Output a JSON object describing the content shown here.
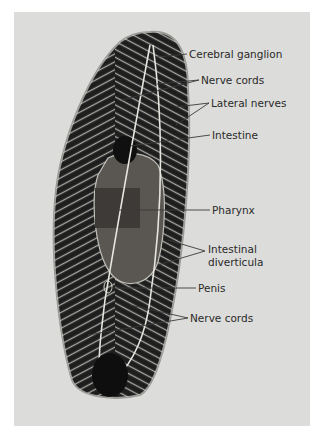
{
  "figure": {
    "background_color": "#dcdcda",
    "body_color": "#1e1e1e",
    "structure_color": "#e8e8e4",
    "labels": [
      {
        "id": "cerebral-ganglion",
        "text": "Cerebral ganglion",
        "x": 189,
        "y": 48
      },
      {
        "id": "nerve-cords-top",
        "text": "Nerve cords",
        "x": 201,
        "y": 74
      },
      {
        "id": "lateral-nerves",
        "text": "Lateral nerves",
        "x": 211,
        "y": 97
      },
      {
        "id": "intestine",
        "text": "Intestine",
        "x": 212,
        "y": 129
      },
      {
        "id": "pharynx",
        "text": "Pharynx",
        "x": 212,
        "y": 204
      },
      {
        "id": "intestinal-diverticula-1",
        "text": "Intestinal",
        "x": 208,
        "y": 243
      },
      {
        "id": "intestinal-diverticula-2",
        "text": "diverticula",
        "x": 208,
        "y": 256
      },
      {
        "id": "penis",
        "text": "Penis",
        "x": 198,
        "y": 282
      },
      {
        "id": "nerve-cords-bottom",
        "text": "Nerve cords",
        "x": 190,
        "y": 312
      }
    ]
  }
}
